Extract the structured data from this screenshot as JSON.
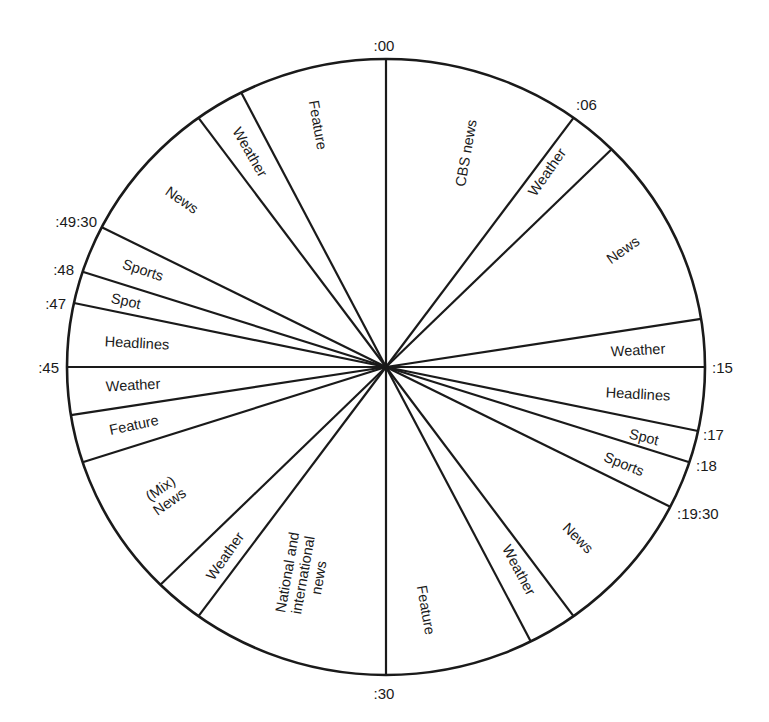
{
  "diagram": {
    "type": "broadcast-hour-clock",
    "center": [
      386,
      367
    ],
    "radius_x": 319,
    "radius_y": 308,
    "colors": {
      "line": "#1a1a1a",
      "background": "#ffffff"
    },
    "boundaries_minutes": [
      0,
      6,
      7.5,
      13.5,
      15,
      17,
      18,
      19.5,
      24,
      25.5,
      30,
      36,
      37.5,
      42,
      43.5,
      45,
      47,
      48,
      49.5,
      54,
      55.5
    ],
    "time_markers": [
      {
        "text": ":00",
        "x": 384,
        "y": 51,
        "anchor": "middle"
      },
      {
        "text": ":06",
        "x": 576,
        "y": 110,
        "anchor": "start"
      },
      {
        "text": ":15",
        "x": 712,
        "y": 373,
        "anchor": "start"
      },
      {
        "text": ":17",
        "x": 703,
        "y": 440,
        "anchor": "start"
      },
      {
        "text": ":18",
        "x": 696,
        "y": 471,
        "anchor": "start"
      },
      {
        "text": ":19:30",
        "x": 677,
        "y": 519,
        "anchor": "start"
      },
      {
        "text": ":30",
        "x": 384,
        "y": 699,
        "anchor": "middle"
      },
      {
        "text": ":45",
        "x": 59,
        "y": 373,
        "anchor": "end"
      },
      {
        "text": ":47",
        "x": 66,
        "y": 309,
        "anchor": "end"
      },
      {
        "text": ":48",
        "x": 74,
        "y": 275,
        "anchor": "end"
      },
      {
        "text": ":49:30",
        "x": 97,
        "y": 227,
        "anchor": "end"
      }
    ],
    "segments": [
      {
        "start": ":00",
        "end": ":06",
        "lines": [
          "CBS news"
        ],
        "x": 466,
        "y": 153,
        "rotate": -80
      },
      {
        "start": ":06",
        "end": ":07:30",
        "lines": [
          "Weather"
        ],
        "x": 547,
        "y": 172,
        "rotate": -55
      },
      {
        "start": ":07:30",
        "end": ":13:30",
        "lines": [
          "News"
        ],
        "x": 623,
        "y": 250,
        "rotate": -35
      },
      {
        "start": ":13:30",
        "end": ":15",
        "lines": [
          "Weather"
        ],
        "x": 638,
        "y": 350,
        "rotate": -3
      },
      {
        "start": ":15",
        "end": ":17",
        "lines": [
          "Headlines"
        ],
        "x": 638,
        "y": 394,
        "rotate": 3
      },
      {
        "start": ":17",
        "end": ":18",
        "lines": [
          "Spot"
        ],
        "x": 644,
        "y": 437,
        "rotate": 14
      },
      {
        "start": ":18",
        "end": ":19:30",
        "lines": [
          "Sports"
        ],
        "x": 624,
        "y": 464,
        "rotate": 22
      },
      {
        "start": ":19:30",
        "end": ":24",
        "lines": [
          "News"
        ],
        "x": 578,
        "y": 538,
        "rotate": 45
      },
      {
        "start": ":24",
        "end": ":25:30",
        "lines": [
          "Weather"
        ],
        "x": 519,
        "y": 570,
        "rotate": 62
      },
      {
        "start": ":25:30",
        "end": ":30",
        "lines": [
          "Feature"
        ],
        "x": 426,
        "y": 610,
        "rotate": 80
      },
      {
        "start": ":30",
        "end": ":36",
        "lines": [
          "National and",
          "international",
          "news"
        ],
        "x": 303,
        "y": 575,
        "rotate": -80
      },
      {
        "start": ":36",
        "end": ":37:30",
        "lines": [
          "Weather"
        ],
        "x": 225,
        "y": 556,
        "rotate": -55
      },
      {
        "start": ":37:30",
        "end": ":42",
        "lines": [
          "(Mix)",
          "News"
        ],
        "x": 165,
        "y": 495,
        "rotate": -35
      },
      {
        "start": ":42",
        "end": ":43:30",
        "lines": [
          "Feature"
        ],
        "x": 134,
        "y": 425,
        "rotate": -12
      },
      {
        "start": ":43:30",
        "end": ":45",
        "lines": [
          "Weather"
        ],
        "x": 133,
        "y": 385,
        "rotate": -3
      },
      {
        "start": ":45",
        "end": ":47",
        "lines": [
          "Headlines"
        ],
        "x": 137,
        "y": 343,
        "rotate": 3
      },
      {
        "start": ":47",
        "end": ":48",
        "lines": [
          "Spot"
        ],
        "x": 126,
        "y": 301,
        "rotate": 12
      },
      {
        "start": ":48",
        "end": ":49:30",
        "lines": [
          "Sports"
        ],
        "x": 143,
        "y": 270,
        "rotate": 18
      },
      {
        "start": ":49:30",
        "end": ":54",
        "lines": [
          "News"
        ],
        "x": 182,
        "y": 200,
        "rotate": 35
      },
      {
        "start": ":54",
        "end": ":55:30",
        "lines": [
          "Weather"
        ],
        "x": 250,
        "y": 152,
        "rotate": 60
      },
      {
        "start": ":55:30",
        "end": ":00",
        "lines": [
          "Feature"
        ],
        "x": 318,
        "y": 125,
        "rotate": 80
      }
    ]
  }
}
